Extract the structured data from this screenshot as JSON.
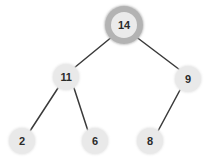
{
  "diagram": {
    "type": "binary-tree",
    "background_color": "#ffffff",
    "node_fill": "#e9e9e9",
    "node_highlight_ring": "#b3b3b3",
    "node_highlight_fill": "#ebebeb",
    "edge_color": "#3a3a3a",
    "edge_width": 1.5,
    "label_color": "#2b2b2b",
    "nodes": [
      {
        "id": "n14",
        "label": "14",
        "cx": 124,
        "cy": 25,
        "r": 13,
        "highlighted": true
      },
      {
        "id": "n11",
        "label": "11",
        "cx": 66,
        "cy": 77,
        "r": 13,
        "highlighted": false
      },
      {
        "id": "n9",
        "label": "9",
        "cx": 188,
        "cy": 79,
        "r": 13,
        "highlighted": false
      },
      {
        "id": "n2",
        "label": "2",
        "cx": 22,
        "cy": 141,
        "r": 13,
        "highlighted": false
      },
      {
        "id": "n6",
        "label": "6",
        "cx": 95,
        "cy": 141,
        "r": 13,
        "highlighted": false
      },
      {
        "id": "n8",
        "label": "8",
        "cx": 150,
        "cy": 141,
        "r": 13,
        "highlighted": false
      }
    ],
    "edges": [
      {
        "id": "e14-11",
        "from": "n14",
        "to": "n11",
        "x1": 113,
        "y1": 36,
        "x2": 74,
        "y2": 68
      },
      {
        "id": "e14-9",
        "from": "n14",
        "to": "n9",
        "x1": 135,
        "y1": 36,
        "x2": 180,
        "y2": 70
      },
      {
        "id": "e11-2",
        "from": "n11",
        "to": "n2",
        "x1": 58,
        "y1": 88,
        "x2": 30,
        "y2": 131
      },
      {
        "id": "e11-6",
        "from": "n11",
        "to": "n6",
        "x1": 74,
        "y1": 88,
        "x2": 88,
        "y2": 131
      },
      {
        "id": "e9-8",
        "from": "n9",
        "to": "n8",
        "x1": 180,
        "y1": 90,
        "x2": 158,
        "y2": 131
      }
    ]
  }
}
